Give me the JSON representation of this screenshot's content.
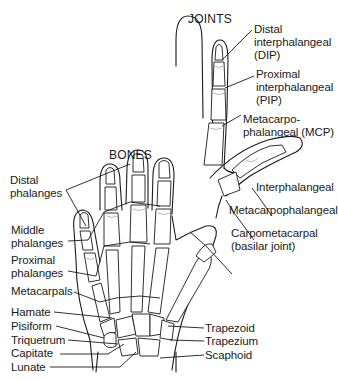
{
  "headings": {
    "joints": "JOINTS",
    "bones": "BONES"
  },
  "joint_labels": [
    {
      "id": "dip",
      "lines": [
        "Distal",
        "interphalangeal",
        "(DIP)"
      ]
    },
    {
      "id": "pip",
      "lines": [
        "Proximal",
        "interphalangeal",
        "(PIP)"
      ]
    },
    {
      "id": "mcp",
      "lines": [
        "Metacarpo-",
        "phalangeal (MCP)"
      ]
    },
    {
      "id": "thumb_ip",
      "lines": [
        "Interphalangeal"
      ]
    },
    {
      "id": "thumb_mcp",
      "lines": [
        "Metacarpophalangeal"
      ]
    },
    {
      "id": "cmc",
      "lines": [
        "Carpometacarpal",
        "(basilar joint)"
      ]
    }
  ],
  "bone_labels_left": [
    {
      "id": "distal_phalanges",
      "lines": [
        "Distal",
        "phalanges"
      ]
    },
    {
      "id": "middle_phalanges",
      "lines": [
        "Middle",
        "phalanges"
      ]
    },
    {
      "id": "proximal_phalanges",
      "lines": [
        "Proximal",
        "phalanges"
      ]
    },
    {
      "id": "metacarpals",
      "lines": [
        "Metacarpals"
      ]
    },
    {
      "id": "hamate",
      "lines": [
        "Hamate"
      ]
    },
    {
      "id": "pisiform",
      "lines": [
        "Pisiform"
      ]
    },
    {
      "id": "triquetrum",
      "lines": [
        "Triquetrum"
      ]
    },
    {
      "id": "capitate",
      "lines": [
        "Capitate"
      ]
    },
    {
      "id": "lunate",
      "lines": [
        "Lunate"
      ]
    }
  ],
  "bone_labels_right": [
    {
      "id": "trapezoid",
      "lines": [
        "Trapezoid"
      ]
    },
    {
      "id": "trapezium",
      "lines": [
        "Trapezium"
      ]
    },
    {
      "id": "scaphoid",
      "lines": [
        "Scaphoid"
      ]
    }
  ]
}
